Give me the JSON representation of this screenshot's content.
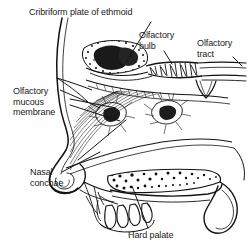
{
  "figure": {
    "view": "midsagittal",
    "style": "pen-and-ink line engraving with stipple and hatching",
    "background_color": "#fefefe",
    "ink_color": "#111111",
    "label_color": "#1a1a1a"
  },
  "labels": {
    "cribriform": "Cribriform plate of ethmoid",
    "bulb": "Olfactory\nbulb",
    "tract": "Olfactory\ntract",
    "mucous": "Olfactory\nmucous\nmembrane",
    "conchae": "Nasal\nconchae",
    "palate": "Hard palate"
  },
  "structures": [
    {
      "name": "cribriform-plate-of-ethmoid",
      "region": "roof of nasal cavity",
      "texture": "dense stipple"
    },
    {
      "name": "olfactory-bulb",
      "region": "above cribriform plate",
      "texture": "fringed hatching"
    },
    {
      "name": "olfactory-tract",
      "region": "posterior to bulb",
      "texture": "parallel lines"
    },
    {
      "name": "olfactory-mucous-membrane",
      "region": "superior nasal wall",
      "texture": "fine hatching"
    },
    {
      "name": "nasal-conchae",
      "region": "lateral nasal wall",
      "texture": "flowing hatch curves"
    },
    {
      "name": "hard-palate",
      "region": "floor of nasal cavity",
      "texture": "coarse stipple"
    },
    {
      "name": "soft-palate",
      "region": "posterior palate",
      "texture": "outline curve"
    },
    {
      "name": "teeth",
      "region": "below hard palate",
      "texture": "outline"
    },
    {
      "name": "facial-profile",
      "region": "anterior contour",
      "texture": "contour line"
    }
  ]
}
